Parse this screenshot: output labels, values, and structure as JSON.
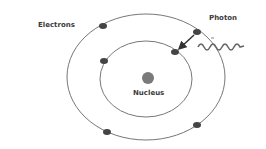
{
  "diagram": {
    "labels": {
      "electrons": "Electrons",
      "photon": "Photon",
      "nucleus": "Nucleus"
    },
    "colors": {
      "orbit": "#777777",
      "electron": "#444444",
      "nucleus": "#7a7a7a",
      "photon_wave": "#666666",
      "text": "#3a3a3a"
    },
    "orbits": [
      {
        "name": "inner",
        "cx": 146,
        "cy": 79,
        "rx": 46,
        "ry": 38
      },
      {
        "name": "outer",
        "cx": 146,
        "cy": 77,
        "rx": 79,
        "ry": 63
      }
    ],
    "electrons": [
      {
        "orbit": "outer",
        "x": 103,
        "y": 26
      },
      {
        "orbit": "outer",
        "x": 197,
        "y": 32
      },
      {
        "orbit": "outer",
        "x": 197,
        "y": 125
      },
      {
        "orbit": "outer",
        "x": 107,
        "y": 132
      },
      {
        "orbit": "inner",
        "x": 104,
        "y": 61
      },
      {
        "orbit": "inner",
        "x": 175,
        "y": 52
      }
    ],
    "transition_arrow": {
      "from": "outer electron (197,32)",
      "to": "inner electron (175,52)"
    }
  }
}
